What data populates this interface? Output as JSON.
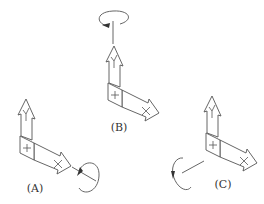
{
  "figure": {
    "panels": [
      {
        "id": "A",
        "label": "(A)",
        "axis_x_label": "X",
        "axis_y_label": "Y",
        "block_mark": "+",
        "rotation_axis": "X",
        "rotation_direction": "around X axis, beyond the X arrow tip"
      },
      {
        "id": "B",
        "label": "(B)",
        "axis_x_label": "X",
        "axis_y_label": "Y",
        "block_mark": "+",
        "rotation_axis": "Y",
        "rotation_direction": "around vertical axis, above the Y arrow tip"
      },
      {
        "id": "C",
        "label": "(C)",
        "axis_x_label": "X",
        "axis_y_label": "Y",
        "block_mark": "+",
        "rotation_axis": "Z",
        "rotation_direction": "around axis pointing out of block to the left"
      }
    ],
    "colors": {
      "line": "#555555",
      "text": "#333333",
      "background": "#ffffff"
    }
  }
}
